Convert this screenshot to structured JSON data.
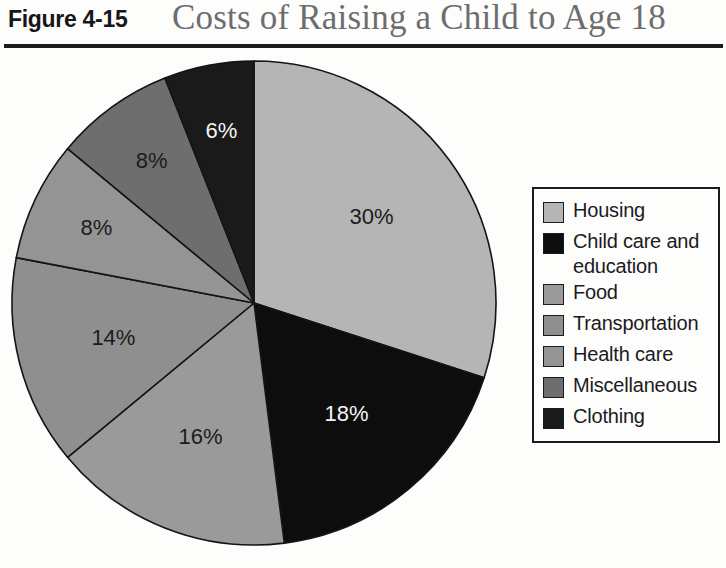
{
  "header": {
    "figure_number": "Figure 4-15",
    "title": "Costs of Raising a Child to Age 18"
  },
  "legend": {
    "items": [
      {
        "label": "Housing",
        "color": "#b5b5b5"
      },
      {
        "label": "Child care and education",
        "color": "#0d0d0d"
      },
      {
        "label": "Food",
        "color": "#9a9a9a"
      },
      {
        "label": "Transportation",
        "color": "#8f8f8f"
      },
      {
        "label": "Health care",
        "color": "#949494"
      },
      {
        "label": "Miscellaneous",
        "color": "#6e6e6e"
      },
      {
        "label": "Clothing",
        "color": "#1a1a1a"
      }
    ]
  },
  "chart_data": {
    "type": "pie",
    "title": "Costs of Raising a Child to Age 18",
    "categories": [
      "Housing",
      "Child care and education",
      "Food",
      "Transportation",
      "Health care",
      "Miscellaneous",
      "Clothing"
    ],
    "values": [
      30,
      18,
      16,
      14,
      8,
      8,
      6
    ],
    "value_labels": [
      "30%",
      "18%",
      "16%",
      "14%",
      "8%",
      "8%",
      "6%"
    ],
    "colors": [
      "#b5b5b5",
      "#0d0d0d",
      "#9a9a9a",
      "#8f8f8f",
      "#949494",
      "#6e6e6e",
      "#1a1a1a"
    ],
    "label_colors": [
      "#1b1b1e",
      "#f4f4f4",
      "#1b1b1e",
      "#1b1b1e",
      "#1b1b1e",
      "#1b1b1e",
      "#f4f4f4"
    ],
    "start_angle_deg": 0,
    "direction": "clockwise",
    "legend_position": "right",
    "units": "percent of total",
    "total": 100
  }
}
